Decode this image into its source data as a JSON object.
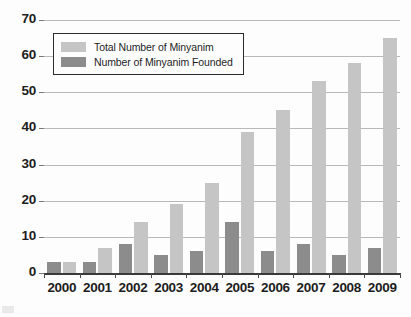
{
  "chart_data": {
    "type": "bar",
    "title": "",
    "subtitle": "",
    "xlabel": "",
    "ylabel": "",
    "categories": [
      "2000",
      "2001",
      "2002",
      "2003",
      "2004",
      "2005",
      "2006",
      "2007",
      "2008",
      "2009"
    ],
    "series": [
      {
        "name": "Number of Minyanim Founded",
        "color": "#8c8c8c",
        "values": [
          3,
          3,
          8,
          5,
          6,
          14,
          6,
          8,
          5,
          7
        ]
      },
      {
        "name": "Total Number of Minyanim",
        "color": "#c5c5c5",
        "values": [
          3,
          7,
          14,
          19,
          25,
          39,
          45,
          53,
          58,
          65
        ]
      }
    ],
    "ylim": [
      0,
      70
    ],
    "ytick_values": [
      0,
      10,
      20,
      30,
      40,
      50,
      60,
      70
    ],
    "ytick_labels": [
      "0",
      "10",
      "20",
      "30",
      "40",
      "50",
      "60",
      "70"
    ],
    "grid": true,
    "grid_axis": "y",
    "legend_position": "upper left",
    "legend_entries": [
      {
        "label": "Total Number of Minyanim",
        "swatch": "total"
      },
      {
        "label": "Number of Minyanim Founded",
        "swatch": "founded"
      }
    ]
  },
  "colors": {
    "total_bar": "#c5c5c5",
    "founded_bar": "#8c8c8c",
    "gridline": "#b9b9b9",
    "axis": "#3a3a3a",
    "text": "#1d1d1d",
    "background": "#fdfdfd"
  }
}
